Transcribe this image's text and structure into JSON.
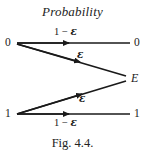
{
  "figure": {
    "title": "Probability",
    "caption": "Fig. 4.4.",
    "type": "binary-erasure-channel-diagram",
    "ink_color": "#1a1a1a",
    "background_color": "#ffffff"
  },
  "nodes": {
    "input_top": "0",
    "input_bottom": "1",
    "output_top": "0",
    "output_bottom": "1",
    "output_erasure": "E"
  },
  "edges": [
    {
      "name": "zero-to-zero",
      "from": "0",
      "to": "0",
      "label_prefix": "1 − ",
      "label_symbol": "ε",
      "label_full": "1 − ε",
      "label_position": "above"
    },
    {
      "name": "zero-to-erasure",
      "from": "0",
      "to": "E",
      "label_prefix": "",
      "label_symbol": "ε",
      "label_full": "ε",
      "label_position": "above"
    },
    {
      "name": "one-to-erasure",
      "from": "1",
      "to": "E",
      "label_prefix": "",
      "label_symbol": "ε",
      "label_full": "ε",
      "label_position": "below"
    },
    {
      "name": "one-to-one",
      "from": "1",
      "to": "1",
      "label_prefix": "1 − ",
      "label_symbol": "ε",
      "label_full": "1 − ε",
      "label_position": "below"
    }
  ]
}
